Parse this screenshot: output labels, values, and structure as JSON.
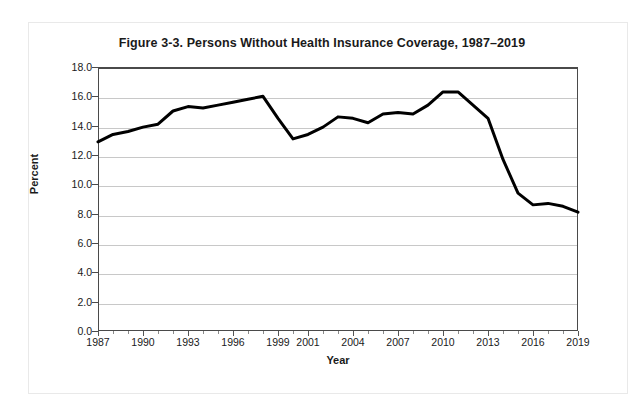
{
  "figure": {
    "title": "Figure 3-3. Persons Without Health Insurance Coverage, 1987–2019",
    "axis_x_label": "Year",
    "axis_y_label": "Percent"
  },
  "chart_data": {
    "type": "line",
    "title": "Figure 3-3. Persons Without Health Insurance Coverage, 1987–2019",
    "xlabel": "Year",
    "ylabel": "Percent",
    "xlim": [
      1987,
      2019
    ],
    "ylim": [
      0.0,
      18.0
    ],
    "ytick_step": 2.0,
    "grid": true,
    "legend": false,
    "line_color": "#000000",
    "line_width": 3,
    "ytick_labels": [
      "0.0",
      "2.0",
      "4.0",
      "6.0",
      "8.0",
      "10.0",
      "12.0",
      "14.0",
      "16.0",
      "18.0"
    ],
    "ytick_values": [
      0.0,
      2.0,
      4.0,
      6.0,
      8.0,
      10.0,
      12.0,
      14.0,
      16.0,
      18.0
    ],
    "xtick_labels": [
      "1987",
      "1990",
      "1993",
      "1996",
      "1999",
      "2001",
      "2004",
      "2007",
      "2010",
      "2013",
      "2016",
      "2019"
    ],
    "xtick_values": [
      1987,
      1990,
      1993,
      1996,
      1999,
      2001,
      2004,
      2007,
      2010,
      2013,
      2016,
      2019
    ],
    "x": [
      1987,
      1988,
      1989,
      1990,
      1991,
      1992,
      1993,
      1994,
      1995,
      1996,
      1997,
      1998,
      1999,
      2000,
      2001,
      2002,
      2003,
      2004,
      2005,
      2006,
      2007,
      2008,
      2009,
      2010,
      2011,
      2012,
      2013,
      2014,
      2015,
      2016,
      2017,
      2018,
      2019
    ],
    "values": [
      12.9,
      13.4,
      13.6,
      13.9,
      14.1,
      15.0,
      15.3,
      15.2,
      15.4,
      15.6,
      15.8,
      16.0,
      14.5,
      13.1,
      13.4,
      13.9,
      14.6,
      14.5,
      14.2,
      14.8,
      14.9,
      14.8,
      15.4,
      16.3,
      16.3,
      15.4,
      14.5,
      11.7,
      9.4,
      8.6,
      8.7,
      8.5,
      8.1
    ],
    "series_name": "Percent of persons without health insurance coverage"
  }
}
